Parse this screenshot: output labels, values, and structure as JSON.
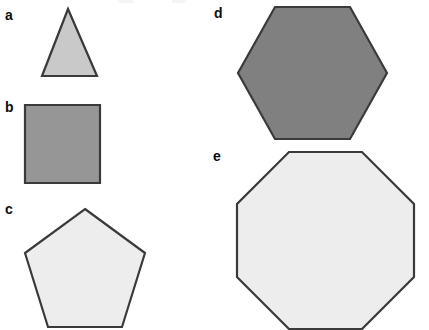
{
  "figure": {
    "width": 429,
    "height": 330,
    "background_color": "#ffffff",
    "labels": {
      "a": "a",
      "b": "b",
      "c": "c",
      "d": "d",
      "e": "e"
    }
  },
  "chart_data": {
    "type": "diagram",
    "title": "",
    "xlabel": "",
    "ylabel": "",
    "shapes": [
      {
        "key": "a",
        "label": "a",
        "name": "triangle",
        "sides": 3,
        "fill": "#c9c9c9",
        "stroke": "#3a3a3a",
        "stroke_width": 2.2,
        "points": "68,9 97,76 42,76",
        "label_x": 5,
        "label_y": 8
      },
      {
        "key": "b",
        "label": "b",
        "name": "square",
        "sides": 4,
        "fill": "#969696",
        "stroke": "#3a3a3a",
        "stroke_width": 2.2,
        "points": "25,105 100,105 100,183 25,183",
        "label_x": 5,
        "label_y": 100
      },
      {
        "key": "c",
        "label": "c",
        "name": "pentagon",
        "sides": 5,
        "fill": "#ededed",
        "stroke": "#3a3a3a",
        "stroke_width": 2.2,
        "points": "85,209 145,253 122,327 48,327 25,253",
        "label_x": 5,
        "label_y": 202
      },
      {
        "key": "d",
        "label": "d",
        "name": "hexagon",
        "sides": 6,
        "fill": "#808080",
        "stroke": "#3a3a3a",
        "stroke_width": 2.2,
        "points": "275,7 350,7 387,73 350,139 275,139 238,73",
        "label_x": 214,
        "label_y": 6
      },
      {
        "key": "e",
        "label": "e",
        "name": "octagon",
        "sides": 8,
        "fill": "#ededed",
        "stroke": "#3a3a3a",
        "stroke_width": 2.2,
        "points": "289,152 362,152 414,204 414,277 362,329 289,329 237,277 237,204",
        "label_x": 213,
        "label_y": 149
      }
    ],
    "legend_position": "none",
    "grid": false
  }
}
